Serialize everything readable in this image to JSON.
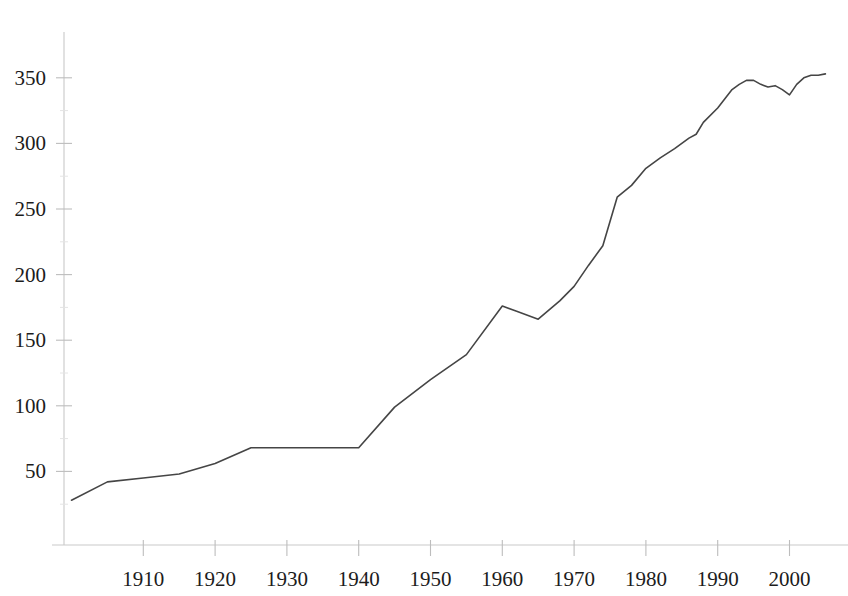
{
  "chart_data": {
    "type": "line",
    "title": "",
    "subtitle": "",
    "xlabel": "",
    "ylabel": "",
    "xlim": [
      1898,
      2006
    ],
    "ylim": [
      0,
      390
    ],
    "grid": false,
    "legend": null,
    "x_ticks": [
      1910,
      1920,
      1930,
      1940,
      1950,
      1960,
      1970,
      1980,
      1990,
      2000
    ],
    "x_tick_labels": [
      "1910",
      "1920",
      "1930",
      "1940",
      "1950",
      "1960",
      "1970",
      "1980",
      "1990",
      "2000"
    ],
    "y_ticks": [
      50,
      100,
      150,
      200,
      250,
      300,
      350
    ],
    "y_tick_labels": [
      "50",
      "100",
      "150",
      "200",
      "250",
      "300",
      "350"
    ],
    "series": [
      {
        "name": "series-1",
        "color": "#454545",
        "x": [
          1900,
          1905,
          1910,
          1915,
          1920,
          1925,
          1930,
          1935,
          1940,
          1945,
          1950,
          1955,
          1960,
          1962,
          1965,
          1968,
          1970,
          1972,
          1974,
          1976,
          1978,
          1980,
          1982,
          1984,
          1986,
          1987,
          1988,
          1990,
          1991,
          1992,
          1993,
          1994,
          1995,
          1996,
          1997,
          1998,
          1999,
          2000,
          2001,
          2002,
          2003,
          2004,
          2005
        ],
        "y": [
          28,
          42,
          45,
          48,
          56,
          68,
          68,
          68,
          68,
          99,
          120,
          139,
          176,
          172,
          166,
          180,
          191,
          207,
          222,
          259,
          268,
          281,
          289,
          296,
          304,
          307,
          316,
          327,
          334,
          341,
          345,
          348,
          348,
          345,
          343,
          344,
          341,
          337,
          345,
          350,
          352,
          352,
          353
        ]
      }
    ]
  },
  "axes": {
    "y_axis_name": "value-axis",
    "x_axis_name": "year-axis"
  }
}
